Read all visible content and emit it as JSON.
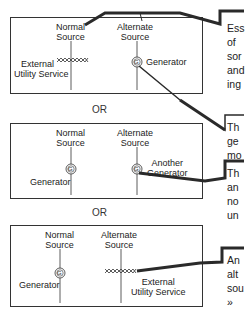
{
  "diagrams": [
    {
      "normal_source": {
        "line1": "Normal",
        "line2": "Source",
        "device": "External",
        "device2": "Utility Service",
        "symbol": "utility-zigzag"
      },
      "alternate_source": {
        "line1": "Alternate",
        "line2": "Source",
        "device": "Generator",
        "symbol": "generator-G"
      }
    },
    {
      "normal_source": {
        "line1": "Normal",
        "line2": "Source",
        "device": "Generator",
        "symbol": "generator-G"
      },
      "alternate_source": {
        "line1": "Alternate",
        "line2": "Source",
        "device": "Another",
        "device2": "Generator",
        "symbol": "generator-G"
      }
    },
    {
      "normal_source": {
        "line1": "Normal",
        "line2": "Source",
        "device": "Generator",
        "symbol": "generator-G"
      },
      "alternate_source": {
        "line1": "Alternate",
        "line2": "Source",
        "device": "External",
        "device2": "Utility Service",
        "symbol": "utility-zigzag"
      }
    }
  ],
  "separators": [
    "OR",
    "OR"
  ],
  "callouts": [
    {
      "lines": [
        "Ess",
        "of",
        "sor",
        "and",
        "ing"
      ]
    },
    {
      "lines": [
        "Th",
        "ge",
        "mo"
      ]
    },
    {
      "lines": [
        "Th",
        "an",
        "no",
        "un"
      ]
    },
    {
      "lines": [
        "An",
        "alt",
        "sou",
        "»"
      ]
    }
  ],
  "generator_glyph": "G",
  "colors": {
    "line": "#333333",
    "connector": "#2a2a2a",
    "text": "#222222"
  }
}
